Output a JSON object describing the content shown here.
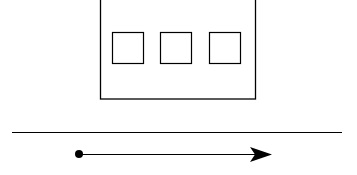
{
  "diagram": {
    "stroke_color": "#000000",
    "background": "#ffffff",
    "container": {
      "x": 100,
      "y": -2,
      "width": 155,
      "height": 101
    },
    "squares": [
      {
        "x": 112,
        "y": 32,
        "size": 31
      },
      {
        "x": 160,
        "y": 32,
        "size": 31
      },
      {
        "x": 209,
        "y": 32,
        "size": 31
      }
    ],
    "ground_line": {
      "x1": 12,
      "y1": 132,
      "x2": 342,
      "y2": 132
    },
    "direction_arrow": {
      "start_x": 79,
      "y": 154,
      "end_x": 272,
      "dot_radius": 4
    }
  }
}
